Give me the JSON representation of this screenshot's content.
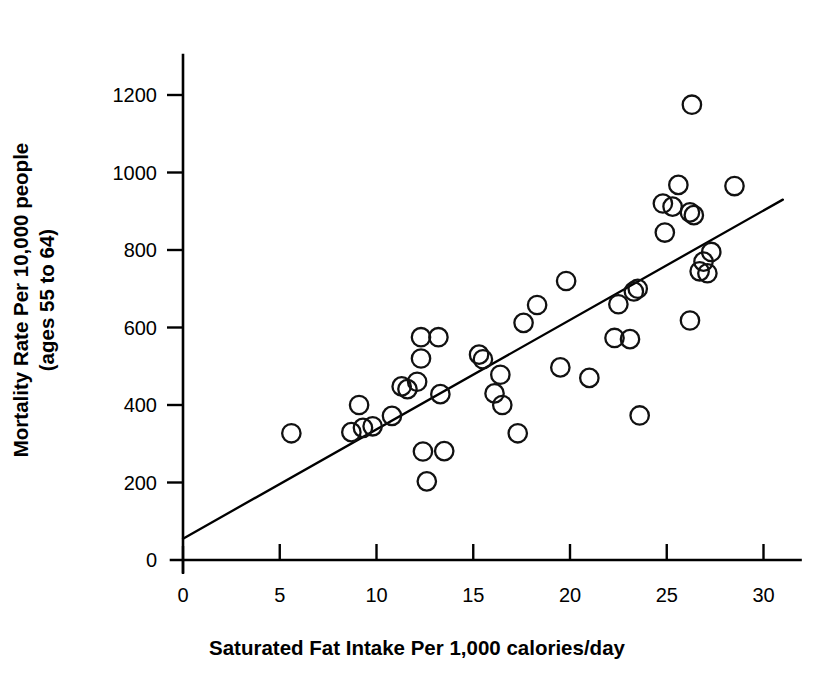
{
  "chart_data": {
    "type": "scatter",
    "title": "",
    "xlabel": "Saturated Fat Intake Per 1,000 calories/day",
    "ylabel_line1": "Mortality Rate Per 10,000 people",
    "ylabel_line2": "(ages 55 to 64)",
    "xlim": [
      0,
      31.5
    ],
    "ylim": [
      0,
      1290
    ],
    "xticks": [
      0,
      5,
      10,
      15,
      20,
      25,
      30
    ],
    "xtick_labels": [
      "0",
      "5",
      "10",
      "15",
      "20",
      "25",
      "30"
    ],
    "yticks": [
      0,
      200,
      400,
      600,
      800,
      1000,
      1200
    ],
    "ytick_labels": [
      "0",
      "200",
      "400",
      "600",
      "800",
      "1000",
      "1200"
    ],
    "grid": false,
    "legend": null,
    "marker": "open-circle",
    "marker_color": "#111111",
    "points": [
      {
        "x": 5.6,
        "y": 327
      },
      {
        "x": 8.7,
        "y": 330
      },
      {
        "x": 9.1,
        "y": 400
      },
      {
        "x": 9.3,
        "y": 341
      },
      {
        "x": 9.8,
        "y": 345
      },
      {
        "x": 10.8,
        "y": 372
      },
      {
        "x": 11.3,
        "y": 448
      },
      {
        "x": 11.6,
        "y": 441
      },
      {
        "x": 12.1,
        "y": 460
      },
      {
        "x": 12.3,
        "y": 575
      },
      {
        "x": 12.3,
        "y": 520
      },
      {
        "x": 12.4,
        "y": 280
      },
      {
        "x": 12.6,
        "y": 203
      },
      {
        "x": 13.2,
        "y": 575
      },
      {
        "x": 13.3,
        "y": 428
      },
      {
        "x": 13.5,
        "y": 281
      },
      {
        "x": 15.3,
        "y": 530
      },
      {
        "x": 15.5,
        "y": 518
      },
      {
        "x": 16.1,
        "y": 430
      },
      {
        "x": 16.4,
        "y": 478
      },
      {
        "x": 16.5,
        "y": 400
      },
      {
        "x": 17.3,
        "y": 327
      },
      {
        "x": 17.6,
        "y": 612
      },
      {
        "x": 18.3,
        "y": 658
      },
      {
        "x": 19.5,
        "y": 497
      },
      {
        "x": 19.8,
        "y": 720
      },
      {
        "x": 21.0,
        "y": 470
      },
      {
        "x": 22.3,
        "y": 573
      },
      {
        "x": 22.5,
        "y": 660
      },
      {
        "x": 23.1,
        "y": 570
      },
      {
        "x": 23.3,
        "y": 693
      },
      {
        "x": 23.5,
        "y": 700
      },
      {
        "x": 23.6,
        "y": 373
      },
      {
        "x": 24.8,
        "y": 920
      },
      {
        "x": 24.9,
        "y": 845
      },
      {
        "x": 25.3,
        "y": 912
      },
      {
        "x": 25.6,
        "y": 968
      },
      {
        "x": 26.2,
        "y": 897
      },
      {
        "x": 26.2,
        "y": 618
      },
      {
        "x": 26.3,
        "y": 1175
      },
      {
        "x": 26.4,
        "y": 890
      },
      {
        "x": 26.7,
        "y": 745
      },
      {
        "x": 26.9,
        "y": 770
      },
      {
        "x": 27.1,
        "y": 740
      },
      {
        "x": 27.3,
        "y": 795
      },
      {
        "x": 28.5,
        "y": 965
      }
    ],
    "trendline": {
      "type": "linear",
      "x_start": 0.0,
      "y_start": 55,
      "x_end": 31.0,
      "y_end": 930,
      "description": "positive linear fit line"
    }
  }
}
